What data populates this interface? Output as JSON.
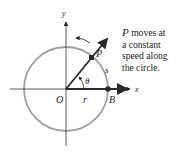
{
  "diagram": {
    "labels": {
      "x_axis": "x",
      "y_axis": "y",
      "origin": "O",
      "point_p": "P",
      "point_b": "B",
      "radius": "r",
      "arc_length": "s",
      "angle": "θ"
    },
    "caption": {
      "subject": "P",
      "line1_rest": " moves at",
      "line2": "a constant",
      "line3": "speed along",
      "line4": "the circle."
    },
    "colors": {
      "circle": "#a0a0a0",
      "axes": "#333333",
      "vectors": "#2a2a2a",
      "text": "#222222"
    }
  }
}
